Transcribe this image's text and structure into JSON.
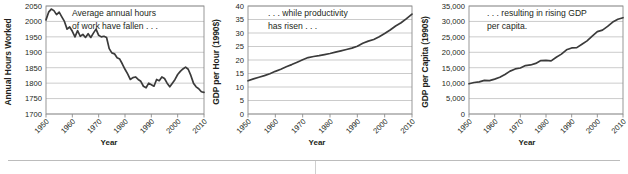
{
  "figure": {
    "panels": [
      {
        "id": "annual-hours-worked",
        "ylabel": "Annual Hours Worked",
        "xlabel": "Year",
        "annotation_line1": "Average annual hours",
        "annotation_line2": "of work have fallen . . .",
        "line_color": "#3b3b3b",
        "grid_color": "#b5b5b5"
      },
      {
        "id": "gdp-per-hour",
        "ylabel": "GDP per Hour (1990$)",
        "xlabel": "Year",
        "annotation_line1": ". . . while productivity",
        "annotation_line2": "has risen . . .",
        "line_color": "#3b3b3b",
        "grid_color": "#b5b5b5"
      },
      {
        "id": "gdp-per-capita",
        "ylabel": "GDP per Capita (1990$)",
        "xlabel": "Year",
        "annotation_line1": ". . . resulting in rising GDP",
        "annotation_line2": "per capita.",
        "line_color": "#3b3b3b",
        "grid_color": "#b5b5b5"
      }
    ]
  },
  "chart_data": [
    {
      "type": "line",
      "title": "",
      "xlabel": "Year",
      "ylabel": "Annual Hours Worked",
      "xlim": [
        1950,
        2010
      ],
      "ylim": [
        1700,
        2050
      ],
      "yticks": [
        1700,
        1750,
        1800,
        1850,
        1900,
        1950,
        2000,
        2050
      ],
      "ytick_labels": [
        "1700",
        "1750",
        "1800",
        "1850",
        "1900",
        "1950",
        "2000",
        "2050"
      ],
      "xticks": [
        1950,
        1960,
        1970,
        1980,
        1990,
        2000,
        2010
      ],
      "xtick_labels": [
        "1950",
        "1960",
        "1970",
        "1980",
        "1990",
        "2000",
        "2010"
      ],
      "grid": true,
      "legend": "none",
      "annotations": [
        "Average annual hours",
        "of work have fallen . . ."
      ],
      "x": [
        1950,
        1951,
        1952,
        1953,
        1954,
        1955,
        1956,
        1957,
        1958,
        1959,
        1960,
        1961,
        1962,
        1963,
        1964,
        1965,
        1966,
        1967,
        1968,
        1969,
        1970,
        1971,
        1972,
        1973,
        1974,
        1975,
        1976,
        1977,
        1978,
        1979,
        1980,
        1981,
        1982,
        1983,
        1984,
        1985,
        1986,
        1987,
        1988,
        1989,
        1990,
        1991,
        1992,
        1993,
        1994,
        1995,
        1996,
        1997,
        1998,
        1999,
        2000,
        2001,
        2002,
        2003,
        2004,
        2005,
        2006,
        2007,
        2008,
        2009,
        2010
      ],
      "y": [
        2005,
        2030,
        2040,
        2035,
        2022,
        2030,
        2015,
        2000,
        1975,
        1982,
        1968,
        1950,
        1970,
        1952,
        1958,
        1948,
        1960,
        1948,
        1962,
        1975,
        1955,
        1950,
        1952,
        1948,
        1912,
        1898,
        1895,
        1882,
        1878,
        1862,
        1845,
        1830,
        1812,
        1818,
        1820,
        1812,
        1806,
        1790,
        1785,
        1800,
        1795,
        1790,
        1812,
        1808,
        1820,
        1815,
        1800,
        1788,
        1800,
        1812,
        1828,
        1838,
        1846,
        1852,
        1845,
        1825,
        1800,
        1788,
        1782,
        1772,
        1770
      ]
    },
    {
      "type": "line",
      "title": "",
      "xlabel": "Year",
      "ylabel": "GDP per Hour (1990$)",
      "xlim": [
        1950,
        2010
      ],
      "ylim": [
        0,
        40
      ],
      "yticks": [
        0,
        5,
        10,
        15,
        20,
        25,
        30,
        35,
        40
      ],
      "ytick_labels": [
        "0",
        "5",
        "10",
        "15",
        "20",
        "25",
        "30",
        "35",
        "40"
      ],
      "xticks": [
        1950,
        1960,
        1970,
        1980,
        1990,
        2000,
        2010
      ],
      "xtick_labels": [
        "1950",
        "1960",
        "1970",
        "1980",
        "1990",
        "2000",
        "2010"
      ],
      "grid": true,
      "legend": "none",
      "annotations": [
        ". . . while productivity",
        "has risen . . ."
      ],
      "x": [
        1950,
        1952,
        1954,
        1956,
        1958,
        1960,
        1962,
        1964,
        1966,
        1968,
        1970,
        1972,
        1974,
        1976,
        1978,
        1980,
        1982,
        1984,
        1986,
        1988,
        1990,
        1992,
        1994,
        1996,
        1998,
        2000,
        2002,
        2004,
        2006,
        2008,
        2010
      ],
      "y": [
        12.3,
        13.0,
        13.6,
        14.2,
        14.9,
        15.8,
        16.6,
        17.5,
        18.3,
        19.2,
        20.1,
        20.9,
        21.3,
        21.6,
        22.0,
        22.4,
        22.9,
        23.4,
        23.9,
        24.4,
        25.1,
        26.2,
        27.0,
        27.6,
        28.6,
        29.8,
        31.1,
        32.6,
        33.8,
        35.3,
        37.0
      ]
    },
    {
      "type": "line",
      "title": "",
      "xlabel": "Year",
      "ylabel": "GDP per Capita (1990$)",
      "xlim": [
        1950,
        2010
      ],
      "ylim": [
        0,
        35000
      ],
      "yticks": [
        0,
        5000,
        10000,
        15000,
        20000,
        25000,
        30000,
        35000
      ],
      "ytick_labels": [
        "0",
        "5,000",
        "10,000",
        "15,000",
        "20,000",
        "25,000",
        "30,000",
        "35,000"
      ],
      "xticks": [
        1950,
        1960,
        1970,
        1980,
        1990,
        2000,
        2010
      ],
      "xtick_labels": [
        "1950",
        "1960",
        "1970",
        "1980",
        "1990",
        "2000",
        "2010"
      ],
      "grid": true,
      "legend": "none",
      "annotations": [
        ". . . resulting in rising GDP",
        "per capita."
      ],
      "x": [
        1950,
        1952,
        1954,
        1956,
        1958,
        1960,
        1962,
        1964,
        1966,
        1968,
        1970,
        1972,
        1974,
        1976,
        1978,
        1980,
        1982,
        1984,
        1986,
        1988,
        1990,
        1992,
        1994,
        1996,
        1998,
        2000,
        2002,
        2004,
        2006,
        2008,
        2010
      ],
      "y": [
        9800,
        10200,
        10400,
        10900,
        10800,
        11300,
        11900,
        12800,
        13900,
        14600,
        14900,
        15700,
        15900,
        16400,
        17300,
        17400,
        17200,
        18400,
        19400,
        20800,
        21400,
        21500,
        22600,
        23700,
        25200,
        26700,
        27200,
        28400,
        29800,
        30700,
        31200
      ]
    }
  ]
}
